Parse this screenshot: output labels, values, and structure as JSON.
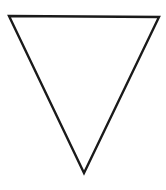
{
  "figure": {
    "shape": "inverted-triangle",
    "background": "#ffffff",
    "stroke_color": "#1a1a1a",
    "fill_color": "#ffffff",
    "stroke_width": 2.4,
    "vertices": {
      "top_left": [
        9,
        16
      ],
      "top_right": [
        159,
        17
      ],
      "bottom": [
        84,
        173
      ]
    }
  }
}
